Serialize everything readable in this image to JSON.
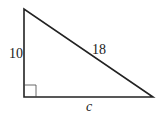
{
  "diagram": {
    "type": "right-triangle",
    "vertices": {
      "top": [
        24,
        9
      ],
      "right_angle": [
        24,
        97
      ],
      "right": [
        153,
        97
      ]
    },
    "right_angle_marker_size": 12,
    "stroke_color": "#222222",
    "labels": {
      "vertical_leg": "10",
      "hypotenuse": "18",
      "horizontal_leg": "c"
    }
  }
}
